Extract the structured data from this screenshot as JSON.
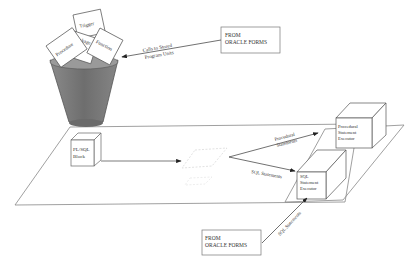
{
  "diagram": {
    "bin": {
      "cards": [
        "Procedure",
        "Trigger",
        "Package",
        "Function"
      ]
    },
    "source_top": {
      "line1": "FROM",
      "line2": "ORACLE FORMS"
    },
    "source_bottom": {
      "line1": "FROM",
      "line2": "ORACLE FORMS"
    },
    "arrows": {
      "calls_line1": "Calls to Stored",
      "calls_line2": "Program Units",
      "procedural_line1": "Procedural",
      "procedural_line2": "Statements",
      "sql_statements": "SQL Statements",
      "sql_statements_bottom": "SQL Statements"
    },
    "plsql_block": {
      "line1": "PL/SQL",
      "line2": "Block"
    },
    "procedural_executor": {
      "line1": "Procedural",
      "line2": "Statement",
      "line3": "Executor"
    },
    "sql_executor": {
      "line1": "SQL",
      "line2": "Statement",
      "line3": "Executor"
    },
    "colors": {
      "line": "#555555",
      "bin_fill": "#777777",
      "faint": "#d8d8d8"
    }
  }
}
